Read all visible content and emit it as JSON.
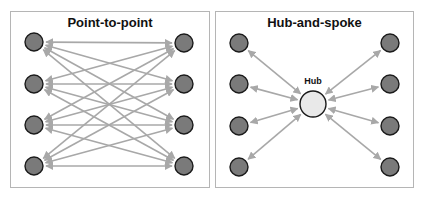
{
  "panels": [
    {
      "id": "point-to-point",
      "title": "Point-to-point",
      "left_nodes": [
        [
          34,
          42
        ],
        [
          34,
          84
        ],
        [
          34,
          125
        ],
        [
          34,
          166
        ]
      ],
      "right_nodes": [
        [
          184,
          43
        ],
        [
          184,
          84
        ],
        [
          184,
          125
        ],
        [
          184,
          166
        ]
      ],
      "connections": "all-left-to-all-right",
      "edge_style": "double-headed arrow"
    },
    {
      "id": "hub-and-spoke",
      "title": "Hub-and-spoke",
      "hub": {
        "label": "Hub",
        "center": [
          313,
          104
        ]
      },
      "spokes": [
        [
          239,
          43
        ],
        [
          239,
          84
        ],
        [
          239,
          126
        ],
        [
          239,
          167
        ],
        [
          390,
          43
        ],
        [
          390,
          84
        ],
        [
          390,
          126
        ],
        [
          390,
          167
        ]
      ],
      "edge_style": "double-headed arrow"
    }
  ],
  "colors": {
    "node_fill": "#7a7a7a",
    "node_stroke": "#1a1a1a",
    "hub_fill": "#e9e9e9",
    "arrow": "#a8a8a8",
    "border": "#b5b5b5"
  }
}
